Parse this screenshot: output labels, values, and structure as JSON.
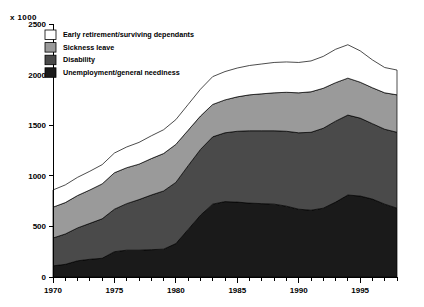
{
  "chart_data": {
    "type": "area",
    "stacked": true,
    "title": "",
    "subtitle": "",
    "xlabel": "",
    "ylabel": "x 1000",
    "unit_label": "x 1000",
    "xlim": [
      1970,
      1998
    ],
    "ylim": [
      0,
      2500
    ],
    "yticks": [
      0,
      500,
      1000,
      1500,
      2000,
      2500
    ],
    "ytick_labels": [
      "0",
      "500",
      "1000",
      "1500",
      "2000",
      "2500"
    ],
    "xticks": [
      1970,
      1975,
      1980,
      1985,
      1990,
      1995
    ],
    "xtick_labels": [
      "1970",
      "1975",
      "1980",
      "1985",
      "1990",
      "1995"
    ],
    "minor_xticks_every": 1,
    "grid": false,
    "legend_position": "top-left",
    "x": [
      1970,
      1971,
      1972,
      1973,
      1974,
      1975,
      1976,
      1977,
      1978,
      1979,
      1980,
      1981,
      1982,
      1983,
      1984,
      1985,
      1986,
      1987,
      1988,
      1989,
      1990,
      1991,
      1992,
      1993,
      1994,
      1995,
      1996,
      1997,
      1998
    ],
    "series": [
      {
        "name": "Unemployment/general neediness",
        "color": "#1a1a1a",
        "values": [
          110,
          125,
          160,
          175,
          185,
          250,
          265,
          265,
          270,
          275,
          330,
          470,
          610,
          720,
          745,
          740,
          730,
          725,
          720,
          700,
          670,
          660,
          680,
          740,
          810,
          800,
          770,
          720,
          680
        ]
      },
      {
        "name": "Disability",
        "color": "#4a4a4a",
        "values": [
          275,
          300,
          325,
          355,
          390,
          420,
          460,
          500,
          540,
          575,
          605,
          630,
          650,
          665,
          680,
          700,
          715,
          720,
          725,
          740,
          755,
          770,
          790,
          800,
          790,
          770,
          745,
          740,
          750
        ]
      },
      {
        "name": "Sickness leave",
        "color": "#9a9a9a",
        "values": [
          305,
          310,
          320,
          330,
          345,
          360,
          355,
          350,
          360,
          370,
          375,
          350,
          330,
          320,
          325,
          340,
          355,
          365,
          375,
          385,
          395,
          400,
          395,
          380,
          365,
          355,
          355,
          360,
          370
        ]
      },
      {
        "name": "Early retirement/surviving dependants",
        "color": "#ffffff",
        "values": [
          170,
          175,
          180,
          185,
          190,
          195,
          205,
          215,
          225,
          235,
          245,
          255,
          265,
          275,
          280,
          285,
          290,
          295,
          300,
          300,
          300,
          305,
          315,
          330,
          330,
          310,
          275,
          250,
          245
        ]
      }
    ],
    "totals": [
      860,
      910,
      985,
      1045,
      1110,
      1225,
      1285,
      1330,
      1395,
      1455,
      1555,
      1705,
      1855,
      1980,
      2030,
      2065,
      2090,
      2105,
      2120,
      2125,
      2120,
      2135,
      2180,
      2250,
      2295,
      2235,
      2145,
      2070,
      2045
    ]
  },
  "legend": {
    "items": [
      {
        "label": "Early retirement/surviving dependants",
        "color": "#ffffff"
      },
      {
        "label": "Sickness leave",
        "color": "#9a9a9a"
      },
      {
        "label": "Disability",
        "color": "#4a4a4a"
      },
      {
        "label": "Unemployment/general neediness",
        "color": "#1a1a1a"
      }
    ]
  }
}
